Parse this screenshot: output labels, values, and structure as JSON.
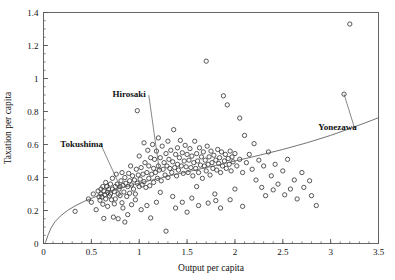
{
  "chart_data": {
    "type": "scatter",
    "title": "",
    "xlabel": "Output per capita",
    "ylabel": "Taxation per capita",
    "xlim": [
      0,
      3.5
    ],
    "ylim": [
      0,
      1.4
    ],
    "xticks": [
      0,
      0.5,
      1,
      1.5,
      2,
      2.5,
      3,
      3.5
    ],
    "xticklabels": [
      "0",
      "0.5",
      "1",
      "1.5",
      "2",
      "2.5",
      "3",
      "3.5"
    ],
    "yticks": [
      0,
      0.2,
      0.4,
      0.6,
      0.8,
      1,
      1.2,
      1.4
    ],
    "yticklabels": [
      "0",
      "0.2",
      "0.4",
      "0.6",
      "0.8",
      "1",
      "1.2",
      "1.4"
    ],
    "x_minor_tick_step": 0.1,
    "y_minor_tick_step": 0.05,
    "grid": false,
    "legend": "none",
    "marker": "open-circle",
    "marker_color": "#3a3a3a",
    "frame_color": "#555555",
    "fit_curve": {
      "label": "fitted regression curve",
      "shape": "concave-logarithmic",
      "color": "#5a5a5a",
      "points": [
        [
          0.02,
          0.005
        ],
        [
          0.05,
          0.055
        ],
        [
          0.08,
          0.095
        ],
        [
          0.12,
          0.132
        ],
        [
          0.18,
          0.168
        ],
        [
          0.25,
          0.2
        ],
        [
          0.33,
          0.228
        ],
        [
          0.42,
          0.254
        ],
        [
          0.52,
          0.278
        ],
        [
          0.62,
          0.3
        ],
        [
          0.72,
          0.32
        ],
        [
          0.82,
          0.338
        ],
        [
          0.95,
          0.358
        ],
        [
          1.1,
          0.38
        ],
        [
          1.25,
          0.401
        ],
        [
          1.4,
          0.421
        ],
        [
          1.6,
          0.447
        ],
        [
          1.8,
          0.473
        ],
        [
          2.0,
          0.5
        ],
        [
          2.25,
          0.534
        ],
        [
          2.5,
          0.57
        ],
        [
          2.75,
          0.61
        ],
        [
          3.0,
          0.655
        ],
        [
          3.25,
          0.707
        ],
        [
          3.5,
          0.762
        ]
      ]
    },
    "annotations": [
      {
        "label": "Hirosaki",
        "text_x": 0.72,
        "text_y": 0.905,
        "point_x": 1.21,
        "point_y": 0.445
      },
      {
        "label": "Tokushima",
        "text_x": 0.175,
        "text_y": 0.605,
        "point_x": 0.8,
        "point_y": 0.345
      },
      {
        "label": "Yonezawa",
        "text_x": 2.87,
        "text_y": 0.705,
        "point_x": 3.14,
        "point_y": 0.905
      }
    ],
    "points": [
      [
        0.33,
        0.195
      ],
      [
        0.47,
        0.27
      ],
      [
        0.5,
        0.25
      ],
      [
        0.52,
        0.3
      ],
      [
        0.55,
        0.205
      ],
      [
        0.57,
        0.318
      ],
      [
        0.58,
        0.283
      ],
      [
        0.59,
        0.262
      ],
      [
        0.6,
        0.33
      ],
      [
        0.6,
        0.3
      ],
      [
        0.61,
        0.282
      ],
      [
        0.62,
        0.345
      ],
      [
        0.62,
        0.238
      ],
      [
        0.63,
        0.318
      ],
      [
        0.63,
        0.152
      ],
      [
        0.64,
        0.296
      ],
      [
        0.65,
        0.37
      ],
      [
        0.65,
        0.27
      ],
      [
        0.66,
        0.345
      ],
      [
        0.67,
        0.31
      ],
      [
        0.67,
        0.225
      ],
      [
        0.68,
        0.33
      ],
      [
        0.69,
        0.288
      ],
      [
        0.7,
        0.36
      ],
      [
        0.7,
        0.3
      ],
      [
        0.71,
        0.265
      ],
      [
        0.72,
        0.395
      ],
      [
        0.72,
        0.33
      ],
      [
        0.73,
        0.16
      ],
      [
        0.74,
        0.315
      ],
      [
        0.75,
        0.345
      ],
      [
        0.75,
        0.27
      ],
      [
        0.76,
        0.42
      ],
      [
        0.77,
        0.36
      ],
      [
        0.78,
        0.3
      ],
      [
        0.78,
        0.15
      ],
      [
        0.79,
        0.33
      ],
      [
        0.8,
        0.345
      ],
      [
        0.8,
        0.29
      ],
      [
        0.81,
        0.38
      ],
      [
        0.82,
        0.43
      ],
      [
        0.82,
        0.247
      ],
      [
        0.83,
        0.352
      ],
      [
        0.84,
        0.312
      ],
      [
        0.85,
        0.4
      ],
      [
        0.85,
        0.13
      ],
      [
        0.86,
        0.365
      ],
      [
        0.87,
        0.285
      ],
      [
        0.88,
        0.345
      ],
      [
        0.89,
        0.425
      ],
      [
        0.9,
        0.38
      ],
      [
        0.9,
        0.305
      ],
      [
        0.91,
        0.47
      ],
      [
        0.92,
        0.355
      ],
      [
        0.93,
        0.41
      ],
      [
        0.94,
        0.33
      ],
      [
        0.95,
        0.385
      ],
      [
        0.96,
        0.3
      ],
      [
        0.97,
        0.45
      ],
      [
        0.98,
        0.365
      ],
      [
        0.98,
        0.805
      ],
      [
        0.99,
        0.415
      ],
      [
        1.0,
        0.345
      ],
      [
        1.0,
        0.53
      ],
      [
        1.01,
        0.39
      ],
      [
        1.02,
        0.46
      ],
      [
        1.03,
        0.355
      ],
      [
        1.04,
        0.42
      ],
      [
        1.05,
        0.61
      ],
      [
        1.05,
        0.375
      ],
      [
        1.06,
        0.49
      ],
      [
        1.07,
        0.34
      ],
      [
        1.08,
        0.43
      ],
      [
        1.09,
        0.565
      ],
      [
        1.1,
        0.395
      ],
      [
        1.1,
        0.47
      ],
      [
        1.11,
        0.35
      ],
      [
        1.12,
        0.52
      ],
      [
        1.13,
        0.42
      ],
      [
        1.14,
        0.6
      ],
      [
        1.15,
        0.455
      ],
      [
        1.15,
        0.37
      ],
      [
        1.16,
        0.51
      ],
      [
        1.17,
        0.43
      ],
      [
        1.18,
        0.56
      ],
      [
        1.19,
        0.395
      ],
      [
        1.2,
        0.47
      ],
      [
        1.2,
        0.64
      ],
      [
        1.21,
        0.445
      ],
      [
        1.22,
        0.52
      ],
      [
        1.23,
        0.38
      ],
      [
        1.24,
        0.59
      ],
      [
        1.25,
        0.45
      ],
      [
        1.26,
        0.49
      ],
      [
        1.27,
        0.415
      ],
      [
        1.28,
        0.545
      ],
      [
        1.29,
        0.47
      ],
      [
        1.3,
        0.4
      ],
      [
        1.3,
        0.62
      ],
      [
        1.31,
        0.51
      ],
      [
        1.32,
        0.455
      ],
      [
        1.33,
        0.565
      ],
      [
        1.34,
        0.43
      ],
      [
        1.35,
        0.495
      ],
      [
        1.36,
        0.69
      ],
      [
        1.37,
        0.46
      ],
      [
        1.38,
        0.54
      ],
      [
        1.39,
        0.41
      ],
      [
        1.4,
        0.58
      ],
      [
        1.4,
        0.48
      ],
      [
        1.41,
        0.445
      ],
      [
        1.42,
        0.52
      ],
      [
        1.43,
        0.625
      ],
      [
        1.44,
        0.47
      ],
      [
        1.45,
        0.55
      ],
      [
        1.46,
        0.425
      ],
      [
        1.47,
        0.5
      ],
      [
        1.48,
        0.595
      ],
      [
        1.49,
        0.465
      ],
      [
        1.5,
        0.54
      ],
      [
        1.5,
        0.19
      ],
      [
        1.51,
        0.43
      ],
      [
        1.52,
        0.505
      ],
      [
        1.53,
        0.575
      ],
      [
        1.54,
        0.46
      ],
      [
        1.55,
        0.53
      ],
      [
        1.56,
        0.41
      ],
      [
        1.57,
        0.49
      ],
      [
        1.58,
        0.62
      ],
      [
        1.59,
        0.455
      ],
      [
        1.6,
        0.545
      ],
      [
        1.6,
        0.345
      ],
      [
        1.61,
        0.5
      ],
      [
        1.62,
        0.43
      ],
      [
        1.63,
        0.58
      ],
      [
        1.64,
        0.475
      ],
      [
        1.65,
        0.525
      ],
      [
        1.66,
        0.395
      ],
      [
        1.67,
        0.555
      ],
      [
        1.68,
        0.47
      ],
      [
        1.69,
        0.505
      ],
      [
        1.7,
        0.44
      ],
      [
        1.7,
        1.105
      ],
      [
        1.71,
        0.59
      ],
      [
        1.72,
        0.48
      ],
      [
        1.73,
        0.525
      ],
      [
        1.74,
        0.415
      ],
      [
        1.75,
        0.56
      ],
      [
        1.76,
        0.49
      ],
      [
        1.77,
        0.455
      ],
      [
        1.78,
        0.535
      ],
      [
        1.79,
        0.3
      ],
      [
        1.8,
        0.505
      ],
      [
        1.8,
        0.26
      ],
      [
        1.81,
        0.445
      ],
      [
        1.82,
        0.57
      ],
      [
        1.83,
        0.485
      ],
      [
        1.84,
        0.52
      ],
      [
        1.85,
        0.43
      ],
      [
        1.86,
        0.555
      ],
      [
        1.87,
        0.47
      ],
      [
        1.88,
        0.895
      ],
      [
        1.89,
        0.5
      ],
      [
        1.9,
        0.54
      ],
      [
        1.91,
        0.455
      ],
      [
        1.92,
        0.84
      ],
      [
        1.93,
        0.515
      ],
      [
        1.94,
        0.48
      ],
      [
        1.95,
        0.56
      ],
      [
        1.96,
        0.44
      ],
      [
        1.97,
        0.525
      ],
      [
        1.98,
        0.495
      ],
      [
        2.0,
        0.545
      ],
      [
        2.0,
        0.33
      ],
      [
        2.02,
        0.47
      ],
      [
        2.05,
        0.76
      ],
      [
        2.05,
        0.51
      ],
      [
        2.08,
        0.43
      ],
      [
        2.1,
        0.655
      ],
      [
        2.12,
        0.49
      ],
      [
        2.15,
        0.54
      ],
      [
        2.18,
        0.45
      ],
      [
        2.2,
        0.605
      ],
      [
        2.22,
        0.385
      ],
      [
        2.25,
        0.505
      ],
      [
        2.28,
        0.34
      ],
      [
        2.3,
        0.47
      ],
      [
        2.32,
        0.29
      ],
      [
        2.35,
        0.555
      ],
      [
        2.38,
        0.41
      ],
      [
        2.4,
        0.325
      ],
      [
        2.42,
        0.48
      ],
      [
        2.45,
        0.36
      ],
      [
        2.5,
        0.44
      ],
      [
        2.52,
        0.295
      ],
      [
        2.55,
        0.51
      ],
      [
        2.58,
        0.33
      ],
      [
        2.62,
        0.385
      ],
      [
        2.65,
        0.27
      ],
      [
        2.7,
        0.43
      ],
      [
        2.72,
        0.34
      ],
      [
        2.78,
        0.38
      ],
      [
        2.8,
        0.29
      ],
      [
        2.85,
        0.23
      ],
      [
        3.14,
        0.905
      ],
      [
        3.2,
        1.33
      ],
      [
        1.28,
        0.075
      ],
      [
        0.88,
        0.175
      ],
      [
        1.02,
        0.205
      ],
      [
        1.12,
        0.155
      ],
      [
        0.92,
        0.235
      ],
      [
        1.18,
        0.25
      ],
      [
        0.96,
        0.265
      ],
      [
        1.35,
        0.285
      ],
      [
        1.22,
        0.31
      ],
      [
        1.45,
        0.25
      ],
      [
        1.55,
        0.275
      ],
      [
        1.62,
        0.23
      ],
      [
        1.72,
        0.245
      ],
      [
        1.85,
        0.215
      ],
      [
        1.95,
        0.265
      ],
      [
        2.08,
        0.225
      ],
      [
        0.74,
        0.24
      ],
      [
        0.83,
        0.215
      ],
      [
        1.08,
        0.23
      ],
      [
        1.38,
        0.215
      ]
    ]
  },
  "axis_label_x": "Output per capita",
  "axis_label_y": "Taxation per capita"
}
